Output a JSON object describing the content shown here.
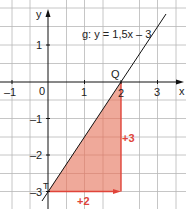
{
  "diagram": {
    "type": "coordinate-graph",
    "axes": {
      "x_label": "x",
      "y_label": "y",
      "x_ticks": [
        "–1",
        "0",
        "1",
        "2",
        "3"
      ],
      "y_ticks": [
        "1",
        "–1",
        "–2",
        "–3"
      ]
    },
    "line": {
      "label": "g: y = 1,5x – 3",
      "slope": 1.5,
      "intercept": -3
    },
    "points": {
      "T": {
        "label": "T",
        "x": 0,
        "y": -3
      },
      "Q": {
        "label": "Q",
        "x": 2,
        "y": 0
      }
    },
    "slope_triangle": {
      "run_label": "+2",
      "rise_label": "+3",
      "fill_color": "#ec9a88",
      "accent_color": "#e0443a"
    }
  }
}
